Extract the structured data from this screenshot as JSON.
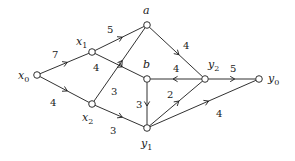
{
  "diagram": {
    "type": "directed-weighted-graph",
    "nodes": [
      {
        "id": "x0",
        "base": "x",
        "sub": "0",
        "x": 37,
        "y": 75,
        "lx": 18,
        "ly": 79
      },
      {
        "id": "x1",
        "base": "x",
        "sub": "1",
        "x": 92,
        "y": 52,
        "lx": 76,
        "ly": 45
      },
      {
        "id": "x2",
        "base": "x",
        "sub": "2",
        "x": 92,
        "y": 104,
        "lx": 82,
        "ly": 121
      },
      {
        "id": "a",
        "base": "a",
        "sub": "",
        "x": 147,
        "y": 25,
        "lx": 143,
        "ly": 14
      },
      {
        "id": "b",
        "base": "b",
        "sub": "",
        "x": 147,
        "y": 79,
        "lx": 143,
        "ly": 68
      },
      {
        "id": "y2",
        "base": "y",
        "sub": "2",
        "x": 205,
        "y": 79,
        "lx": 208,
        "ly": 68
      },
      {
        "id": "y0",
        "base": "y",
        "sub": "0",
        "x": 259,
        "y": 79,
        "lx": 268,
        "ly": 82
      },
      {
        "id": "y1",
        "base": "y",
        "sub": "1",
        "x": 147,
        "y": 128,
        "lx": 141,
        "ly": 147
      }
    ],
    "edges": [
      {
        "from": "x0",
        "to": "x1",
        "weight": "7",
        "wx": 52,
        "wy": 58
      },
      {
        "from": "x0",
        "to": "x2",
        "weight": "4",
        "wx": 50,
        "wy": 106
      },
      {
        "from": "x1",
        "to": "a",
        "weight": "5",
        "wx": 107,
        "wy": 33
      },
      {
        "from": "x1",
        "to": "b",
        "weight": "4",
        "wx": 93,
        "wy": 71
      },
      {
        "from": "x2",
        "to": "a",
        "weight": "3",
        "wx": 111,
        "wy": 95
      },
      {
        "from": "x2",
        "to": "y1",
        "weight": "3",
        "wx": 110,
        "wy": 134
      },
      {
        "from": "a",
        "to": "y2",
        "weight": "4",
        "wx": 183,
        "wy": 49
      },
      {
        "from": "y2",
        "to": "b",
        "weight": "4",
        "wx": 173,
        "wy": 72
      },
      {
        "from": "y2",
        "to": "y0",
        "weight": "5",
        "wx": 230,
        "wy": 72
      },
      {
        "from": "b",
        "to": "y1",
        "weight": "3",
        "wx": 136,
        "wy": 108
      },
      {
        "from": "y1",
        "to": "y2",
        "weight": "2",
        "wx": 167,
        "wy": 98
      },
      {
        "from": "y1",
        "to": "y0",
        "weight": "4",
        "wx": 216,
        "wy": 117
      }
    ]
  }
}
